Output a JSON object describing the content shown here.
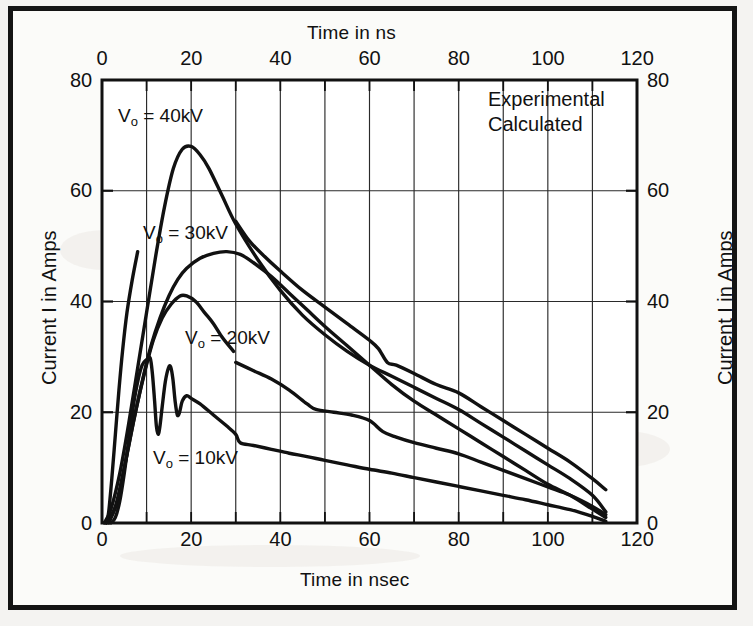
{
  "figure": {
    "background_color": "#f4f3f1",
    "frame_color": "#141414",
    "plot_background": "#ffffff",
    "ink_color": "#111111"
  },
  "axes": {
    "top_axis_title": "Time in ns",
    "bottom_axis_title": "Time in nsec",
    "left_axis_title": "Current I in Amps",
    "right_axis_title": "Current I in Amps",
    "x_ticks": [
      "0",
      "20",
      "40",
      "60",
      "80",
      "100",
      "120"
    ],
    "y_ticks": [
      "0",
      "20",
      "40",
      "60",
      "80"
    ],
    "y_ticks_right": [
      "0",
      "20",
      "40",
      "60",
      "80"
    ]
  },
  "legend": {
    "entries": [
      {
        "label": "Experimental"
      },
      {
        "label": "Calculated"
      }
    ]
  },
  "curve_labels": [
    {
      "prefix": "V",
      "sub": "o",
      "suffix": " = 40kV",
      "full": "Vo = 40kV"
    },
    {
      "prefix": "V",
      "sub": "o",
      "suffix": " = 30kV",
      "full": "Vo = 30kV"
    },
    {
      "prefix": "V",
      "sub": "o",
      "suffix": " = 20kV",
      "full": "Vo = 20kV"
    },
    {
      "prefix": "V",
      "sub": "o",
      "suffix": " = 10kV",
      "full": "Vo = 10kV"
    }
  ],
  "caption": {
    "line1": "",
    "line2": ""
  },
  "chart_data": {
    "type": "line",
    "title": "",
    "xlabel": "Time in nsec",
    "ylabel": "Current I in Amps",
    "xlabel_top": "Time in ns",
    "ylabel_right": "Current I in Amps",
    "xlim": [
      0,
      120
    ],
    "ylim": [
      0,
      80
    ],
    "xticks": [
      0,
      20,
      40,
      60,
      80,
      100,
      120
    ],
    "yticks": [
      0,
      20,
      40,
      60,
      80
    ],
    "grid": true,
    "grid_x_step": 10,
    "grid_y_step": 20,
    "legend": [
      "Experimental",
      "Calculated"
    ],
    "legend_position": "top-right-inside",
    "series": [
      {
        "name": "Vo = 40kV",
        "annotation": "Vo = 40kV",
        "kind": "calculated",
        "points": [
          [
            0.5,
            0.0
          ],
          [
            2.0,
            2.5
          ],
          [
            4.0,
            9.0
          ],
          [
            6.0,
            18.0
          ],
          [
            8.0,
            28.0
          ],
          [
            10.0,
            38.0
          ],
          [
            12.0,
            48.0
          ],
          [
            14.0,
            57.0
          ],
          [
            16.0,
            64.0
          ],
          [
            18.0,
            67.5
          ],
          [
            20.0,
            68.0
          ],
          [
            22.0,
            66.5
          ],
          [
            24.0,
            64.0
          ],
          [
            27.0,
            59.0
          ],
          [
            30.0,
            54.0
          ],
          [
            35.0,
            47.5
          ],
          [
            40.0,
            42.0
          ],
          [
            45.0,
            37.5
          ],
          [
            50.0,
            34.0
          ],
          [
            55.0,
            31.0
          ],
          [
            60.0,
            28.5
          ],
          [
            65.0,
            26.5
          ],
          [
            70.0,
            24.5
          ],
          [
            75.0,
            22.5
          ],
          [
            80.0,
            20.5
          ],
          [
            85.0,
            18.0
          ],
          [
            90.0,
            15.5
          ],
          [
            95.0,
            13.0
          ],
          [
            100.0,
            10.5
          ],
          [
            105.0,
            8.0
          ],
          [
            110.0,
            5.0
          ],
          [
            113.0,
            2.0
          ]
        ]
      },
      {
        "name": "Vo = 40kV experimental tail",
        "annotation": "",
        "kind": "experimental",
        "points": [
          [
            30.0,
            54.5
          ],
          [
            33.0,
            51.0
          ],
          [
            36.0,
            48.5
          ],
          [
            40.0,
            45.5
          ],
          [
            45.0,
            42.0
          ],
          [
            50.0,
            39.0
          ],
          [
            55.0,
            36.0
          ],
          [
            60.0,
            33.0
          ],
          [
            62.0,
            31.5
          ],
          [
            64.0,
            29.0
          ],
          [
            66.0,
            28.5
          ],
          [
            70.0,
            27.0
          ],
          [
            75.0,
            25.0
          ],
          [
            80.0,
            23.5
          ],
          [
            85.0,
            21.0
          ],
          [
            90.0,
            18.5
          ],
          [
            95.0,
            16.0
          ],
          [
            100.0,
            13.5
          ],
          [
            105.0,
            11.0
          ],
          [
            110.0,
            8.0
          ],
          [
            113.0,
            6.0
          ]
        ]
      },
      {
        "name": "Vo = 30kV",
        "annotation": "Vo = 30kV",
        "kind": "calculated",
        "points": [
          [
            1.0,
            0.0
          ],
          [
            3.0,
            3.0
          ],
          [
            5.0,
            10.0
          ],
          [
            7.0,
            18.0
          ],
          [
            9.0,
            25.5
          ],
          [
            11.0,
            32.0
          ],
          [
            13.0,
            37.0
          ],
          [
            15.0,
            41.0
          ],
          [
            17.0,
            44.0
          ],
          [
            19.0,
            46.0
          ],
          [
            22.0,
            47.8
          ],
          [
            25.0,
            48.7
          ],
          [
            28.0,
            49.0
          ],
          [
            31.0,
            48.5
          ],
          [
            34.0,
            47.0
          ],
          [
            38.0,
            44.5
          ],
          [
            42.0,
            41.5
          ],
          [
            46.0,
            38.5
          ],
          [
            50.0,
            35.5
          ],
          [
            55.0,
            32.0
          ],
          [
            60.0,
            28.5
          ],
          [
            65.0,
            25.0
          ],
          [
            70.0,
            22.0
          ],
          [
            75.0,
            19.5
          ],
          [
            80.0,
            17.0
          ],
          [
            85.0,
            14.5
          ],
          [
            90.0,
            12.0
          ],
          [
            95.0,
            9.5
          ],
          [
            100.0,
            7.0
          ],
          [
            105.0,
            5.0
          ],
          [
            110.0,
            2.5
          ],
          [
            113.0,
            1.0
          ]
        ]
      },
      {
        "name": "Vo = 20kV",
        "annotation": "Vo = 20kV",
        "kind": "calculated",
        "points": [
          [
            1.5,
            0.0
          ],
          [
            3.5,
            4.0
          ],
          [
            5.5,
            12.0
          ],
          [
            7.5,
            20.0
          ],
          [
            9.5,
            27.0
          ],
          [
            11.5,
            33.0
          ],
          [
            13.5,
            37.0
          ],
          [
            15.5,
            39.5
          ],
          [
            17.5,
            41.0
          ],
          [
            19.0,
            41.0
          ],
          [
            21.0,
            40.0
          ],
          [
            23.0,
            38.0
          ],
          [
            25.0,
            36.0
          ],
          [
            27.0,
            33.5
          ],
          [
            29.5,
            31.0
          ]
        ]
      },
      {
        "name": "Vo = 20kV experimental",
        "annotation": "",
        "kind": "experimental",
        "points": [
          [
            30.0,
            29.0
          ],
          [
            34.0,
            27.5
          ],
          [
            38.0,
            26.0
          ],
          [
            42.0,
            24.0
          ],
          [
            46.0,
            21.5
          ],
          [
            48.0,
            20.5
          ],
          [
            52.0,
            20.0
          ],
          [
            56.0,
            19.5
          ],
          [
            60.0,
            18.5
          ],
          [
            63.0,
            16.5
          ],
          [
            66.0,
            15.5
          ],
          [
            70.0,
            14.5
          ],
          [
            75.0,
            13.5
          ],
          [
            80.0,
            12.5
          ],
          [
            85.0,
            11.0
          ],
          [
            90.0,
            9.5
          ],
          [
            95.0,
            8.0
          ],
          [
            100.0,
            6.5
          ],
          [
            105.0,
            5.0
          ],
          [
            110.0,
            3.0
          ],
          [
            113.0,
            1.5
          ]
        ]
      },
      {
        "name": "Vo = 10kV experimental oscillating",
        "annotation": "Vo = 10kV",
        "kind": "experimental",
        "points": [
          [
            2.0,
            0.0
          ],
          [
            3.0,
            1.0
          ],
          [
            4.0,
            4.0
          ],
          [
            5.0,
            9.0
          ],
          [
            6.0,
            15.0
          ],
          [
            7.0,
            21.0
          ],
          [
            8.0,
            25.5
          ],
          [
            9.0,
            28.5
          ],
          [
            10.0,
            29.5
          ],
          [
            10.8,
            29.8
          ],
          [
            11.3,
            27.0
          ],
          [
            11.8,
            22.0
          ],
          [
            12.2,
            17.5
          ],
          [
            12.6,
            16.0
          ],
          [
            13.0,
            17.5
          ],
          [
            13.5,
            21.0
          ],
          [
            14.2,
            25.5
          ],
          [
            14.9,
            28.0
          ],
          [
            15.4,
            28.2
          ],
          [
            15.9,
            26.0
          ],
          [
            16.4,
            22.0
          ],
          [
            16.9,
            19.5
          ],
          [
            17.4,
            20.0
          ],
          [
            18.0,
            22.0
          ],
          [
            19.0,
            23.0
          ],
          [
            20.0,
            22.5
          ],
          [
            22.0,
            21.5
          ],
          [
            25.0,
            19.5
          ],
          [
            28.0,
            17.5
          ],
          [
            30.0,
            16.0
          ],
          [
            31.0,
            14.5
          ],
          [
            34.0,
            14.0
          ],
          [
            38.0,
            13.3
          ],
          [
            42.0,
            12.6
          ],
          [
            46.0,
            12.0
          ],
          [
            50.0,
            11.3
          ],
          [
            55.0,
            10.5
          ],
          [
            60.0,
            9.7
          ],
          [
            65.0,
            9.0
          ],
          [
            70.0,
            8.2
          ],
          [
            75.0,
            7.4
          ],
          [
            80.0,
            6.6
          ],
          [
            85.0,
            5.8
          ],
          [
            90.0,
            5.0
          ],
          [
            95.0,
            4.2
          ],
          [
            100.0,
            3.3
          ],
          [
            105.0,
            2.4
          ],
          [
            110.0,
            1.2
          ],
          [
            113.0,
            0.3
          ]
        ]
      },
      {
        "name": "Vo = 10kV rise envelope",
        "annotation": "",
        "kind": "experimental",
        "points": [
          [
            1.0,
            0.0
          ],
          [
            1.5,
            2.0
          ],
          [
            2.2,
            8.0
          ],
          [
            3.0,
            16.0
          ],
          [
            3.8,
            24.0
          ],
          [
            4.6,
            31.0
          ],
          [
            5.6,
            38.0
          ],
          [
            6.8,
            44.0
          ],
          [
            8.0,
            49.0
          ]
        ]
      }
    ]
  }
}
